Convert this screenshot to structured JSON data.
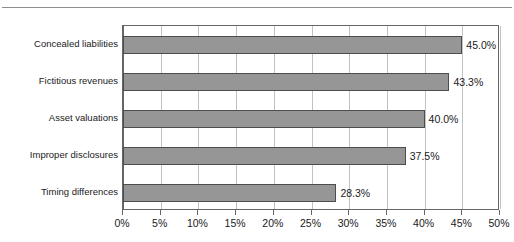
{
  "page": {
    "clipped_heading": "",
    "background_color": "#ffffff"
  },
  "chart_data": {
    "type": "bar",
    "orientation": "horizontal",
    "title": "",
    "xlabel": "",
    "ylabel": "",
    "categories": [
      "Concealed liabilities",
      "Fictitious revenues",
      "Asset valuations",
      "Improper disclosures",
      "Timing differences"
    ],
    "values": [
      45.0,
      43.3,
      40.0,
      37.5,
      28.3
    ],
    "data_labels": [
      "45.0%",
      "43.3%",
      "40.0%",
      "37.5%",
      "28.3%"
    ],
    "xlim": [
      0,
      50
    ],
    "xtick_values": [
      0,
      5,
      10,
      15,
      20,
      25,
      30,
      35,
      40,
      45,
      50
    ],
    "xtick_labels": [
      "0%",
      "5%",
      "10%",
      "15%",
      "20%",
      "25%",
      "30%",
      "35%",
      "40%",
      "45%",
      "50%"
    ],
    "grid": true,
    "grid_axis": "x",
    "legend": false,
    "colors": {
      "bar_fill": "#969696",
      "bar_border": "#4d4d4d",
      "gridline": "#c2c2c2",
      "axis": "#666666",
      "text": "#1a1a1a",
      "rule": "#8d8d8d"
    }
  }
}
